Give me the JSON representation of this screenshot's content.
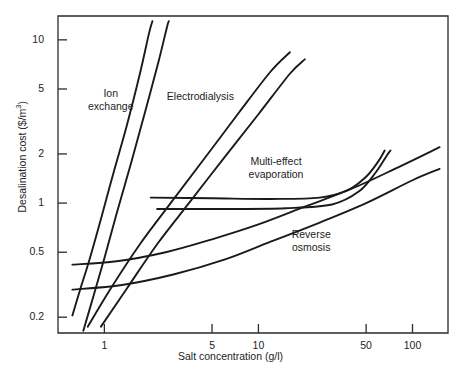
{
  "chart_data": {
    "type": "line",
    "title": "",
    "xlabel": "Salt concentration (g/l)",
    "ylabel": "Desalination cost ($/m3)",
    "ylabel_prefix": "Desalination cost ($/m",
    "ylabel_exponent": "3",
    "ylabel_suffix": ")",
    "xscale": "log",
    "yscale": "log",
    "xlim": [
      0.5,
      170
    ],
    "ylim": [
      0.16,
      14
    ],
    "grid": false,
    "legend": "inline-annotations",
    "xticks": [
      1,
      5,
      10,
      50,
      100
    ],
    "xtick_labels": [
      "1",
      "5",
      "10",
      "50",
      "100"
    ],
    "yticks": [
      0.2,
      0.5,
      1,
      2,
      5,
      10
    ],
    "ytick_labels": [
      "0.2",
      "0.5",
      "1",
      "2",
      "5",
      "10"
    ],
    "annotations": [
      {
        "text": "Ion\nexchange",
        "line1": "Ion",
        "line2": "exchange",
        "x": 1.1,
        "y": 4.6
      },
      {
        "text": "Electrodialysis",
        "line1": "Electrodialysis",
        "line2": "",
        "x": 4.2,
        "y": 4.4
      },
      {
        "text": "Multi-effect\nevaporation",
        "line1": "Multi-effect",
        "line2": "evaporation",
        "x": 13.0,
        "y": 1.75
      },
      {
        "text": "Reverse\nosmosis",
        "line1": "Reverse",
        "line2": "osmosis",
        "x": 22.0,
        "y": 0.63
      }
    ],
    "series": [
      {
        "name": "Ion exchange (upper bound)",
        "points": [
          [
            0.62,
            0.205
          ],
          [
            0.7,
            0.3
          ],
          [
            0.8,
            0.45
          ],
          [
            0.95,
            0.8
          ],
          [
            1.15,
            1.55
          ],
          [
            1.4,
            3.0
          ],
          [
            1.7,
            6.2
          ],
          [
            1.95,
            11.0
          ],
          [
            2.05,
            13.0
          ]
        ]
      },
      {
        "name": "Ion exchange (lower bound)",
        "points": [
          [
            0.73,
            0.165
          ],
          [
            0.85,
            0.27
          ],
          [
            1.0,
            0.46
          ],
          [
            1.2,
            0.86
          ],
          [
            1.5,
            1.8
          ],
          [
            1.85,
            3.7
          ],
          [
            2.25,
            7.4
          ],
          [
            2.55,
            12.0
          ],
          [
            2.62,
            13.0
          ]
        ]
      },
      {
        "name": "Electrodialysis (upper bound)",
        "points": [
          [
            0.78,
            0.175
          ],
          [
            1.1,
            0.3
          ],
          [
            1.7,
            0.56
          ],
          [
            2.8,
            1.05
          ],
          [
            4.6,
            1.95
          ],
          [
            7.5,
            3.6
          ],
          [
            12.0,
            6.4
          ],
          [
            16.0,
            8.4
          ]
        ]
      },
      {
        "name": "Electrodialysis (lower bound)",
        "points": [
          [
            0.95,
            0.175
          ],
          [
            1.4,
            0.3
          ],
          [
            2.2,
            0.56
          ],
          [
            3.6,
            1.02
          ],
          [
            6.0,
            1.9
          ],
          [
            10.0,
            3.5
          ],
          [
            16.0,
            6.2
          ],
          [
            20.0,
            7.6
          ]
        ]
      },
      {
        "name": "Multi-effect evaporation (upper bound)",
        "points": [
          [
            2.0,
            1.08
          ],
          [
            5.0,
            1.07
          ],
          [
            12.0,
            1.06
          ],
          [
            25.0,
            1.08
          ],
          [
            38.0,
            1.2
          ],
          [
            50.0,
            1.45
          ],
          [
            60.0,
            1.8
          ],
          [
            66.0,
            2.1
          ]
        ]
      },
      {
        "name": "Multi-effect evaporation (lower bound)",
        "points": [
          [
            2.2,
            0.92
          ],
          [
            6.0,
            0.92
          ],
          [
            15.0,
            0.93
          ],
          [
            30.0,
            0.98
          ],
          [
            45.0,
            1.18
          ],
          [
            58.0,
            1.55
          ],
          [
            68.0,
            1.95
          ],
          [
            72.0,
            2.1
          ]
        ]
      },
      {
        "name": "Reverse osmosis (upper bound)",
        "points": [
          [
            0.62,
            0.42
          ],
          [
            1.2,
            0.44
          ],
          [
            2.5,
            0.5
          ],
          [
            5.0,
            0.6
          ],
          [
            10.0,
            0.74
          ],
          [
            20.0,
            0.95
          ],
          [
            40.0,
            1.22
          ],
          [
            80.0,
            1.65
          ],
          [
            150.0,
            2.2
          ]
        ]
      },
      {
        "name": "Reverse osmosis (lower bound)",
        "points": [
          [
            0.62,
            0.295
          ],
          [
            1.3,
            0.315
          ],
          [
            2.8,
            0.365
          ],
          [
            6.0,
            0.45
          ],
          [
            12.0,
            0.58
          ],
          [
            25.0,
            0.76
          ],
          [
            50.0,
            1.0
          ],
          [
            100.0,
            1.38
          ],
          [
            150.0,
            1.62
          ]
        ]
      }
    ]
  },
  "axes": {
    "y_label_prefix": "Desalination cost ($/m",
    "y_label_exponent": "3",
    "y_label_suffix": ")",
    "x_label": "Salt concentration (g/l)"
  },
  "colors": {
    "curve": "#1a1a1a",
    "axis": "#2b2b2b",
    "text": "#1d1d1d",
    "background": "#ffffff"
  }
}
